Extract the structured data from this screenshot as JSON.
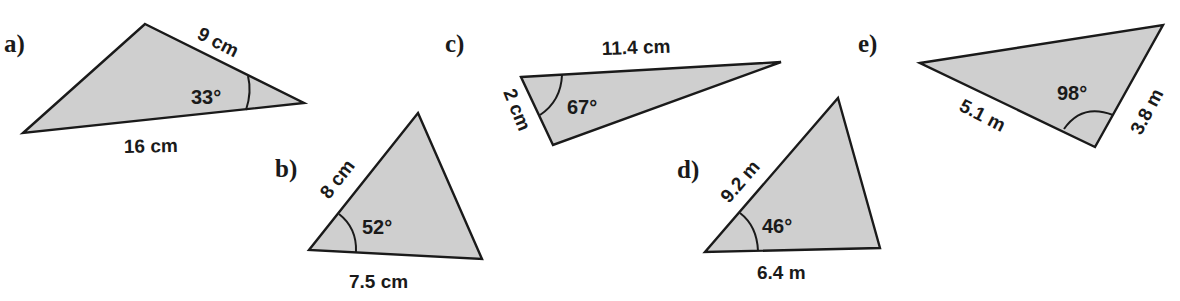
{
  "triangles": [
    {
      "label": "a)",
      "vertices": [
        [
          145,
          24
        ],
        [
          304,
          103
        ],
        [
          23,
          133
        ]
      ],
      "sides": [
        {
          "text": "9 cm"
        },
        {
          "text": "16 cm"
        }
      ],
      "angle": "33°"
    },
    {
      "label": "b)",
      "vertices": [
        [
          418,
          113
        ],
        [
          482,
          259
        ],
        [
          309,
          250
        ]
      ],
      "sides": [
        {
          "text": "8 cm"
        },
        {
          "text": "7.5 cm"
        }
      ],
      "angle": "52°"
    },
    {
      "label": "c)",
      "vertices": [
        [
          521,
          77
        ],
        [
          781,
          62
        ],
        [
          553,
          145
        ]
      ],
      "sides": [
        {
          "text": "11.4 cm"
        },
        {
          "text": "2 cm"
        }
      ],
      "angle": "67°"
    },
    {
      "label": "d)",
      "vertices": [
        [
          838,
          98
        ],
        [
          880,
          248
        ],
        [
          705,
          252
        ]
      ],
      "sides": [
        {
          "text": "9.2 m"
        },
        {
          "text": "6.4 m"
        }
      ],
      "angle": "46°"
    },
    {
      "label": "e)",
      "vertices": [
        [
          920,
          63
        ],
        [
          1163,
          25
        ],
        [
          1095,
          147
        ]
      ],
      "sides": [
        {
          "text": "5.1 m"
        },
        {
          "text": "3.8 m"
        }
      ],
      "angle": "98°"
    }
  ],
  "colors": {
    "fill": "#cfcfcf",
    "stroke": "#1a1a1a",
    "background": "#ffffff"
  }
}
